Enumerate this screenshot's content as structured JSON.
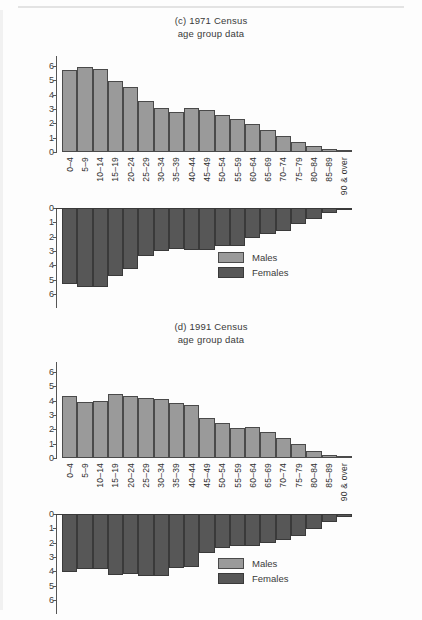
{
  "figure": {
    "bar_color_males": "#9a9a9a",
    "bar_color_females": "#575757"
  },
  "legend": {
    "males": "Males",
    "females": "Females"
  },
  "charts": [
    {
      "id": "chart-1971",
      "title_line1": "(c) 1971 Census",
      "title_line2": "age group data"
    },
    {
      "id": "chart-1991",
      "title_line1": "(d) 1991 Census",
      "title_line2": "age group data"
    }
  ],
  "chart_data": [
    {
      "type": "bar",
      "title": "(c) 1971 Census age group data",
      "subtitle": "age group data",
      "xlabel": "",
      "ylabel": "",
      "ylim": [
        0,
        6
      ],
      "yticks": [
        0,
        1,
        2,
        3,
        4,
        5,
        6
      ],
      "grid": false,
      "legend_position": "bottom-right",
      "orientation": "population-pyramid-vertical",
      "categories": [
        "0–4",
        "5–9",
        "10–14",
        "15–19",
        "20–24",
        "25–29",
        "30–34",
        "35–39",
        "40–44",
        "45–49",
        "50–54",
        "55–59",
        "60–64",
        "65–69",
        "70–74",
        "75–79",
        "80–84",
        "85–89",
        "90 & over"
      ],
      "series": [
        {
          "name": "Males",
          "values": [
            5.7,
            5.95,
            5.8,
            4.95,
            4.55,
            3.55,
            3.05,
            2.8,
            3.08,
            2.95,
            2.58,
            2.3,
            1.98,
            1.55,
            1.15,
            0.7,
            0.42,
            0.18,
            0.05
          ]
        },
        {
          "name": "Females",
          "values": [
            5.3,
            5.5,
            5.5,
            4.75,
            4.25,
            3.35,
            3.0,
            2.88,
            2.95,
            2.92,
            2.62,
            2.62,
            2.1,
            1.78,
            1.6,
            1.12,
            0.75,
            0.35,
            0.12
          ]
        }
      ]
    },
    {
      "type": "bar",
      "title": "(d) 1991 Census age group data",
      "subtitle": "age group data",
      "xlabel": "",
      "ylabel": "",
      "ylim": [
        0,
        6
      ],
      "yticks": [
        0,
        1,
        2,
        3,
        4,
        5,
        6
      ],
      "grid": false,
      "legend_position": "bottom-right",
      "orientation": "population-pyramid-vertical",
      "categories": [
        "0–4",
        "5–9",
        "10–14",
        "15–19",
        "20–24",
        "25–29",
        "30–34",
        "35–39",
        "40–44",
        "45–49",
        "50–54",
        "55–59",
        "60–64",
        "65–69",
        "70–74",
        "75–79",
        "80–84",
        "85–89",
        "90 & over"
      ],
      "series": [
        {
          "name": "Males",
          "values": [
            4.35,
            3.88,
            3.98,
            4.5,
            4.3,
            4.2,
            4.15,
            3.82,
            3.68,
            2.82,
            2.42,
            2.1,
            2.18,
            1.82,
            1.4,
            0.95,
            0.5,
            0.22,
            0.05
          ]
        },
        {
          "name": "Females",
          "values": [
            4.02,
            3.82,
            3.85,
            4.28,
            4.22,
            4.35,
            4.3,
            3.78,
            3.68,
            2.75,
            2.38,
            2.22,
            2.2,
            2.05,
            1.78,
            1.5,
            1.05,
            0.55,
            0.18
          ]
        }
      ]
    }
  ]
}
